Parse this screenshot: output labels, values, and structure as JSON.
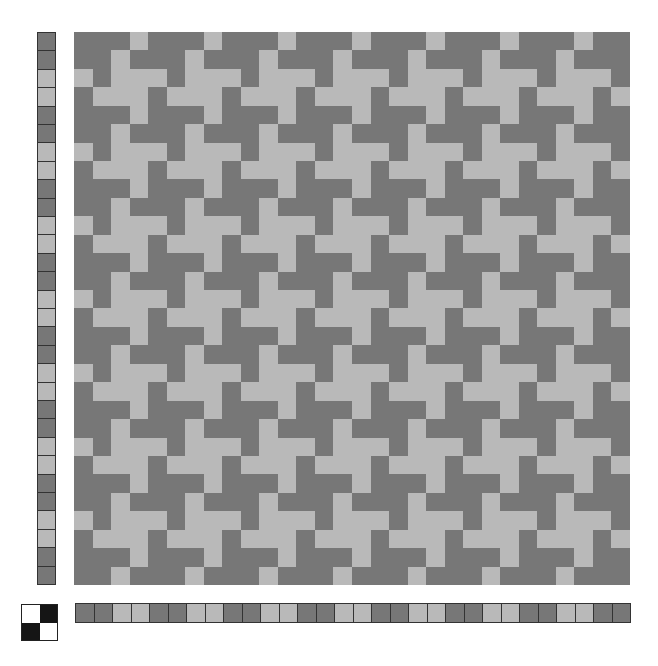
{
  "colors": {
    "dark": "#777777",
    "light": "#b9b9b9",
    "tieup_filled": "#151515",
    "tieup_empty": "#ffffff"
  },
  "grid": {
    "rows": 30,
    "cols": 30
  },
  "weft_colors": [
    "D",
    "D",
    "L",
    "L",
    "D",
    "D",
    "L",
    "L",
    "D",
    "D",
    "L",
    "L",
    "D",
    "D",
    "L",
    "L",
    "D",
    "D",
    "L",
    "L",
    "D",
    "D",
    "L",
    "L",
    "D",
    "D",
    "L",
    "L",
    "D",
    "D"
  ],
  "warp_colors": [
    "D",
    "D",
    "L",
    "L",
    "D",
    "D",
    "L",
    "L",
    "D",
    "D",
    "L",
    "L",
    "D",
    "D",
    "L",
    "L",
    "D",
    "D",
    "L",
    "L",
    "D",
    "D",
    "L",
    "L",
    "D",
    "D",
    "L",
    "L",
    "D",
    "D"
  ],
  "threading_shaft_by_col_mod4": [
    0,
    1,
    1,
    0
  ],
  "treadling_by_row_mod4": [
    0,
    1,
    1,
    0
  ],
  "tieup": [
    [
      0,
      1
    ],
    [
      1,
      0
    ]
  ]
}
